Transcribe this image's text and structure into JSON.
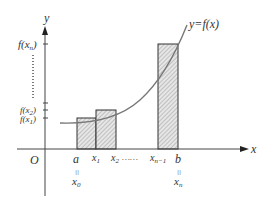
{
  "diagram": {
    "curve_label": "y=f(x)",
    "axes": {
      "x_label": "x",
      "y_label": "y",
      "origin_label": "O"
    },
    "y_ticks": [
      {
        "label": "f(x",
        "sub": "n",
        "close": ")"
      },
      {
        "label": "f(x",
        "sub": "2",
        "close": ")"
      },
      {
        "label": "f(x",
        "sub": "1",
        "close": ")"
      }
    ],
    "x_ticks": [
      {
        "label": "a",
        "eq": "||",
        "alt": "x",
        "alt_sub": "0"
      },
      {
        "label": "x",
        "sub": "1"
      },
      {
        "label": "x",
        "sub": "2"
      },
      {
        "label": "x",
        "sub": "n−1"
      },
      {
        "label": "b",
        "eq": "||",
        "alt": "x",
        "alt_sub": "n"
      }
    ],
    "ellipsis": "……",
    "colors": {
      "axis": "#444444",
      "curve": "#777777",
      "rect_stroke": "#333333",
      "hatch": "#999999"
    }
  }
}
